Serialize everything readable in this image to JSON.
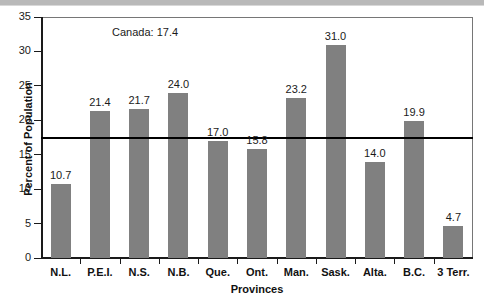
{
  "chart_data": {
    "type": "bar",
    "title": "",
    "subtitle": "",
    "xlabel": "Provinces",
    "ylabel": "Percent of Population",
    "ylim": [
      0,
      35
    ],
    "yticks": [
      0,
      5,
      10,
      15,
      20,
      25,
      30,
      35
    ],
    "ytick_labels": [
      "0",
      "5",
      "10",
      "15",
      "20",
      "25",
      "30",
      "35"
    ],
    "grid": false,
    "legend": "none",
    "bar_color": "#808080",
    "categories": [
      "N.L.",
      "P.E.I.",
      "N.S.",
      "N.B.",
      "Que.",
      "Ont.",
      "Man.",
      "Sask.",
      "Alta.",
      "B.C.",
      "3 Terr."
    ],
    "values": [
      10.7,
      21.4,
      21.7,
      24.0,
      17.0,
      15.8,
      23.2,
      31.0,
      14.0,
      19.9,
      4.7
    ],
    "value_labels": [
      "10.7",
      "21.4",
      "21.7",
      "24.0",
      "17.0",
      "15.8",
      "23.2",
      "31.0",
      "14.0",
      "19.9",
      "4.7"
    ],
    "reference_line": {
      "label": "Canada: 17.4",
      "value": 17.4,
      "color": "#000000"
    }
  }
}
